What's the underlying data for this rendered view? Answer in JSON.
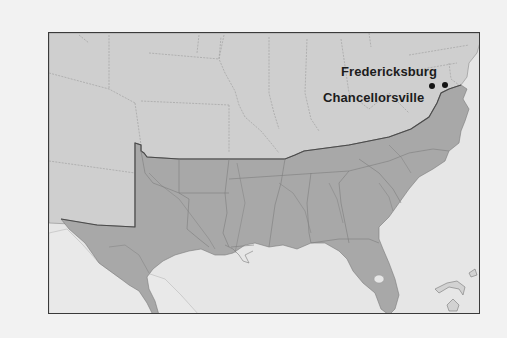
{
  "map": {
    "region": "Southeastern United States",
    "legend_colors": {
      "confederate_states": "#a8a8a8",
      "other_states": "#cfcfcf",
      "water": "#e6e6e6",
      "background": "#f2f2f2",
      "frame_border": "#3a3a3a"
    },
    "places": [
      {
        "name": "Fredericksburg",
        "marker": "dot-icon"
      },
      {
        "name": "Chancellorsville",
        "marker": "dot-icon"
      }
    ]
  }
}
